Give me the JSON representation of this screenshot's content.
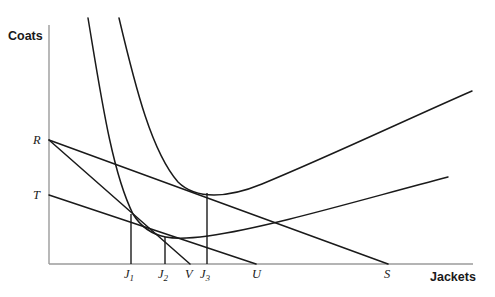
{
  "figure": {
    "kind": "indifference-curve-budget-line-diagram",
    "background_color": "#ffffff",
    "stroke_color": "#1a1a1a",
    "axis_color": "#9b9b9b"
  },
  "axes": {
    "y_title": "Coats",
    "x_title": "Jackets",
    "origin": {
      "x": 49,
      "y": 264
    },
    "x_end": 473,
    "y_top": 25
  },
  "y_axis_labels": [
    {
      "name": "R",
      "text": "R",
      "x": 33,
      "y": 144,
      "point_y": 140
    },
    {
      "name": "T",
      "text": "T",
      "x": 33,
      "y": 199,
      "point_y": 195
    }
  ],
  "x_axis_labels": [
    {
      "name": "J1",
      "text": "J",
      "sub": "1",
      "x": 124,
      "y": 278,
      "point_x": 131
    },
    {
      "name": "J2",
      "text": "J",
      "sub": "2",
      "x": 158,
      "y": 278,
      "point_x": 165
    },
    {
      "name": "V",
      "text": "V",
      "sub": "",
      "x": 185,
      "y": 278,
      "point_x": 190
    },
    {
      "name": "J3",
      "text": "J",
      "sub": "3",
      "x": 200,
      "y": 278,
      "point_x": 207
    },
    {
      "name": "U",
      "text": "U",
      "sub": "",
      "x": 252,
      "y": 278,
      "point_x": 256
    },
    {
      "name": "S",
      "text": "S",
      "sub": "",
      "x": 384,
      "y": 278,
      "point_x": 388
    }
  ],
  "budget_lines": [
    {
      "name": "line-R-S",
      "from_label": "R",
      "to_label": "S",
      "x1": 49,
      "y1": 140,
      "x2": 388,
      "y2": 264
    },
    {
      "name": "line-R-V",
      "from_label": "R",
      "to_label": "V",
      "x1": 49,
      "y1": 140,
      "x2": 190,
      "y2": 264
    },
    {
      "name": "line-T-U",
      "from_label": "T",
      "to_label": "U",
      "x1": 49,
      "y1": 195,
      "x2": 256,
      "y2": 264
    }
  ],
  "indifference_curves": [
    {
      "name": "indifference-curve-lower",
      "path": "M 88 18 C 101 96, 112 172, 133 214 C 150 242, 178 240, 208 236 C 270 227, 360 200, 448 177",
      "tangency_label": "J1",
      "minimum_label": "J2"
    },
    {
      "name": "indifference-curve-upper",
      "path": "M 119 18 C 136 90, 152 152, 178 182 C 196 200, 228 198, 262 184 C 330 156, 410 118, 472 91",
      "tangency_label": "J3"
    }
  ],
  "drop_lines": [
    {
      "name": "drop-line-J1",
      "x": 131,
      "y_top": 214,
      "y_bottom": 264
    },
    {
      "name": "drop-line-J2",
      "x": 165,
      "y_top": 237,
      "y_bottom": 264
    },
    {
      "name": "drop-line-J3",
      "x": 207,
      "y_top": 193,
      "y_bottom": 264
    }
  ]
}
